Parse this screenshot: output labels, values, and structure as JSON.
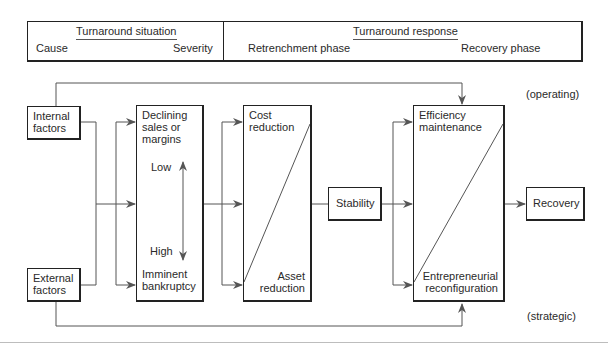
{
  "header": {
    "situation": {
      "title": "Turnaround situation",
      "left": "Cause",
      "right": "Severity"
    },
    "response": {
      "title": "Turnaround response",
      "left": "Retrenchment phase",
      "right": "Recovery phase"
    }
  },
  "nodes": {
    "internal": [
      "Internal",
      "factors"
    ],
    "external": [
      "External",
      "factors"
    ],
    "declining": [
      "Declining",
      "sales or",
      "margins"
    ],
    "low": "Low",
    "high": "High",
    "imminent": [
      "Imminent",
      "bankruptcy"
    ],
    "cost": [
      "Cost",
      "reduction"
    ],
    "asset": [
      "Asset",
      "reduction"
    ],
    "stability": "Stability",
    "efficiency": [
      "Efficiency",
      "maintenance"
    ],
    "entrepreneurial": [
      "Entrepreneurial",
      "reconfiguration"
    ],
    "recovery": "Recovery"
  },
  "annotations": {
    "operating": "(operating)",
    "strategic": "(strategic)"
  },
  "colors": {
    "line": "#555555",
    "border": "#222222",
    "text": "#2a2a2a"
  }
}
